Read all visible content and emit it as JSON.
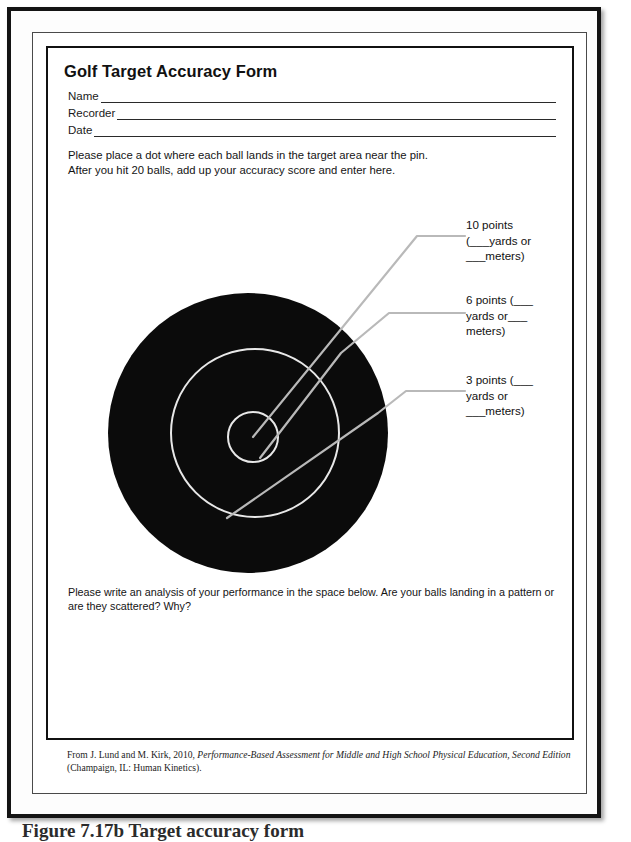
{
  "document": {
    "title": "Golf Target Accuracy Form",
    "fields": [
      {
        "label": "Name"
      },
      {
        "label": "Recorder"
      },
      {
        "label": "Date"
      }
    ],
    "instructions": [
      "Please place a dot where each ball lands in the target area near the pin.",
      "After you hit 20 balls, add up your accuracy score and enter here."
    ],
    "target": {
      "alt": "concentric-target-diagram",
      "rings": [
        {
          "name": "outer-ring",
          "points": "3 points",
          "fill": "#0b0b0b"
        },
        {
          "name": "middle-ring",
          "points": "6 points",
          "stroke": "#e8e8e8"
        },
        {
          "name": "bullseye",
          "points": "10 points",
          "stroke": "#e8e8e8"
        }
      ],
      "annotations": [
        {
          "id": "ten",
          "line1": "10 points",
          "line2": "(___yards or",
          "line3": "___meters)"
        },
        {
          "id": "six",
          "line1": "6 points (___",
          "line2": "yards or___",
          "line3": "meters)"
        },
        {
          "id": "three",
          "line1": "3 points (___",
          "line2": "yards or",
          "line3": "___meters)"
        }
      ]
    },
    "analysis_prompt": "Please write an analysis of your performance in the space below. Are your balls landing in a pattern or are they scattered? Why?",
    "citation": {
      "prefix": "From J. Lund and M. Kirk, 2010, ",
      "italic_title": "Performance-Based Assessment for Middle and High School Physical Education, Second Edition",
      "suffix": " (Champaign, IL: Human Kinetics)."
    },
    "figure_caption": "Figure 7.17b  Target accuracy form"
  },
  "colors": {
    "page": "#ffffff",
    "ink": "#111111",
    "target_fill": "#0b0b0b",
    "ring_stroke": "#e8e8e8",
    "leader_line": "#b9b9b9",
    "frame": "#141414"
  }
}
